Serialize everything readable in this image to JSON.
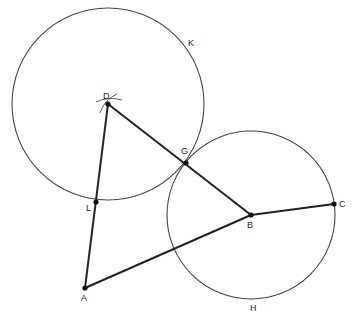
{
  "diagram": {
    "type": "geometric-construction",
    "points": [
      {
        "name": "D",
        "label": "D",
        "x": 108,
        "y": 104,
        "lx": 103,
        "ly": 99
      },
      {
        "name": "G",
        "label": "G",
        "x": 186,
        "y": 163,
        "lx": 181,
        "ly": 154
      },
      {
        "name": "B",
        "label": "B",
        "x": 251,
        "y": 215,
        "lx": 247,
        "ly": 228
      },
      {
        "name": "C",
        "label": "C",
        "x": 334,
        "y": 204,
        "lx": 339,
        "ly": 207
      },
      {
        "name": "A",
        "label": "A",
        "x": 85,
        "y": 288,
        "lx": 81,
        "ly": 301
      },
      {
        "name": "L",
        "label": "L",
        "x": 96,
        "y": 202,
        "lx": 86,
        "ly": 211
      }
    ],
    "circles": [
      {
        "name": "K",
        "label": "K",
        "cx": 108,
        "cy": 104,
        "r": 96,
        "lx": 188,
        "ly": 46
      },
      {
        "name": "H",
        "label": "H",
        "cx": 251,
        "cy": 215,
        "r": 84,
        "lx": 250,
        "ly": 311
      }
    ],
    "segments": [
      {
        "from": "A",
        "to": "D"
      },
      {
        "from": "D",
        "to": "B"
      },
      {
        "from": "A",
        "to": "B"
      },
      {
        "from": "B",
        "to": "C"
      }
    ],
    "colors": {
      "line": "#222222",
      "circle": "#444444",
      "point": "#111111"
    }
  }
}
